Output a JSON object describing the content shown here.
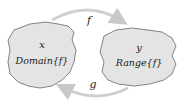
{
  "diagram": {
    "domain_set": {
      "variable": "x",
      "label": "Domain{f}",
      "fill": "#e4e4e4",
      "stroke": "#555555"
    },
    "range_set": {
      "variable": "y",
      "label": "Range{f}",
      "fill": "#e4e4e4",
      "stroke": "#555555"
    },
    "arrows": [
      {
        "name": "f",
        "label": "f",
        "from": "domain",
        "to": "range"
      },
      {
        "name": "g",
        "label": "g",
        "from": "range",
        "to": "domain"
      }
    ],
    "arrow_color": "#d0d0d0"
  }
}
